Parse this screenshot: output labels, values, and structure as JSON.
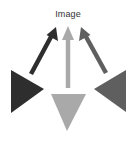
{
  "diagram": {
    "title": "Image",
    "colors": {
      "dark": "#2e2e2e",
      "light": "#a9a9a9",
      "mid": "#5f5f5f",
      "background": "#ffffff"
    },
    "nodes": [
      {
        "id": "left-triangle",
        "shape": "triangle-right",
        "color": "dark",
        "points": "11,70 11,113 44,89"
      },
      {
        "id": "bottom-triangle",
        "shape": "triangle-down",
        "color": "light",
        "points": "51,94 86,94 67,131"
      },
      {
        "id": "right-triangle",
        "shape": "triangle-left",
        "color": "mid",
        "points": "126,70 126,112 94,89"
      }
    ],
    "arrows": [
      {
        "id": "arrow-dark",
        "from": "left-triangle",
        "to": "title",
        "color": "dark",
        "x1": 31,
        "y1": 74,
        "x2": 56,
        "y2": 27
      },
      {
        "id": "arrow-light",
        "from": "bottom-triangle",
        "to": "title",
        "color": "light",
        "x1": 68,
        "y1": 88,
        "x2": 68,
        "y2": 26
      },
      {
        "id": "arrow-mid",
        "from": "right-triangle",
        "to": "title",
        "color": "mid",
        "x1": 106,
        "y1": 73,
        "x2": 81,
        "y2": 27
      }
    ]
  }
}
